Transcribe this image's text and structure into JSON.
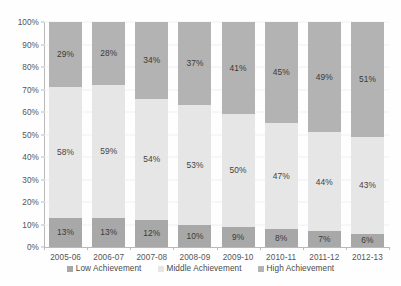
{
  "chart_data": {
    "type": "bar",
    "subtype": "stacked-100",
    "title": "",
    "xlabel": "",
    "ylabel": "",
    "ylim": [
      0,
      100
    ],
    "ytick_labels": [
      "0%",
      "10%",
      "20%",
      "30%",
      "40%",
      "50%",
      "60%",
      "70%",
      "80%",
      "90%",
      "100%"
    ],
    "ytick_values": [
      0,
      10,
      20,
      30,
      40,
      50,
      60,
      70,
      80,
      90,
      100
    ],
    "grid": true,
    "legend_position": "bottom",
    "categories": [
      "2005-06",
      "2006-07",
      "2007-08",
      "2008-09",
      "2009-10",
      "2010-11",
      "2011-12",
      "2012-13"
    ],
    "series": [
      {
        "name": "Low Achievement",
        "color": "#a8a8a8",
        "values": [
          13,
          13,
          12,
          10,
          9,
          8,
          7,
          6
        ],
        "labels": [
          "13%",
          "13%",
          "12%",
          "10%",
          "9%",
          "8%",
          "7%",
          "6%"
        ]
      },
      {
        "name": "Middle Achievement",
        "color": "#e6e6e6",
        "values": [
          58,
          59,
          54,
          53,
          50,
          47,
          44,
          43
        ],
        "labels": [
          "58%",
          "59%",
          "54%",
          "53%",
          "50%",
          "47%",
          "44%",
          "43%"
        ]
      },
      {
        "name": "High Achievement",
        "color": "#b3b3b3",
        "values": [
          29,
          28,
          34,
          37,
          41,
          45,
          49,
          51
        ],
        "labels": [
          "29%",
          "28%",
          "34%",
          "37%",
          "41%",
          "45%",
          "49%",
          "51%"
        ]
      }
    ]
  },
  "legend": {
    "items": [
      {
        "label": "Low Achievement",
        "color": "#a8a8a8"
      },
      {
        "label": "Middle Achievement",
        "color": "#e6e6e6"
      },
      {
        "label": "High Achievement",
        "color": "#b3b3b3"
      }
    ]
  },
  "axes": {
    "y_axis_color": "#b9b9b9",
    "x_axis_color": "#b9b9b9",
    "gridline_color": "#f0f0f0"
  }
}
